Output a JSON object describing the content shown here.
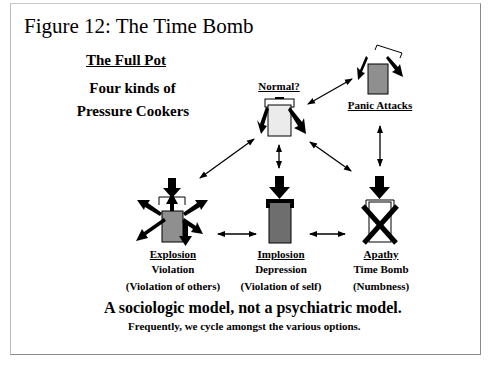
{
  "figure": {
    "title": "Figure 12: The Time Bomb",
    "heading": "The Full Pot",
    "subheading_line1": "Four kinds of",
    "subheading_line2": "Pressure Cookers"
  },
  "nodes": {
    "normal": {
      "label": "Normal?",
      "fill": "#ebebeb"
    },
    "panic": {
      "label": "Panic Attacks",
      "fill": "#8f8f8f"
    },
    "explosion": {
      "label": "Explosion",
      "line2": "Violation",
      "line3": "(Violation of others)",
      "fill": "#8f8f8f"
    },
    "implosion": {
      "label": "Implosion",
      "line2": "Depression",
      "line3": "(Violation of self)",
      "fill": "#6e6e6e"
    },
    "apathy": {
      "label": "Apathy",
      "line2": "Time Bomb",
      "line3": "(Numbness)",
      "fill": "#ffffff"
    }
  },
  "footer": {
    "main": "A sociologic model, not a psychiatric model.",
    "note": "Frequently, we cycle amongst the various options."
  }
}
